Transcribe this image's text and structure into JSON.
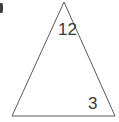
{
  "figure": {
    "shape_name": "triangle",
    "fill": "#ffffff",
    "stroke_color": "#5a5a5a",
    "stroke_width": 1,
    "background": "#ffffff",
    "label_color": "#3a3a3a",
    "artifact": {
      "name": "cropped-list-marker",
      "text": ")"
    },
    "vertices": [
      {
        "name": "apex",
        "x": 64,
        "y": 2
      },
      {
        "name": "bottom-right",
        "x": 115,
        "y": 116
      },
      {
        "name": "bottom-left",
        "x": 12,
        "y": 116
      }
    ],
    "labels": [
      {
        "name": "apex-angle",
        "text": "12",
        "x": 58,
        "y": 21
      },
      {
        "name": "bottom-right-angle",
        "text": "3",
        "x": 88,
        "y": 95
      }
    ]
  },
  "chart_data": {
    "type": "diagram",
    "shape": "triangle",
    "vertex_count": 3,
    "points": [
      [
        64,
        2
      ],
      [
        115,
        116
      ],
      [
        12,
        116
      ]
    ],
    "annotations": [
      "12",
      "3"
    ],
    "filled": false
  }
}
